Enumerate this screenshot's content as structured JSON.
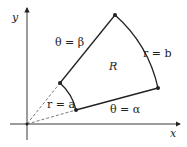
{
  "diagram": {
    "axes": {
      "x_label": "x",
      "y_label": "y"
    },
    "region_label": "R",
    "boundary_labels": {
      "theta_beta": "θ = β",
      "theta_alpha": "θ = α",
      "r_a": "r = a",
      "r_b": "r = b"
    },
    "points": [
      {
        "name": "inner-beta",
        "x": 60,
        "y": 83
      },
      {
        "name": "outer-beta",
        "x": 115,
        "y": 15
      },
      {
        "name": "outer-alpha",
        "x": 158,
        "y": 88
      },
      {
        "name": "inner-alpha",
        "x": 76,
        "y": 110
      }
    ],
    "origin": {
      "x": 27,
      "y": 124
    },
    "colors": {
      "stroke": "#222222",
      "dashed": "#555555"
    }
  }
}
